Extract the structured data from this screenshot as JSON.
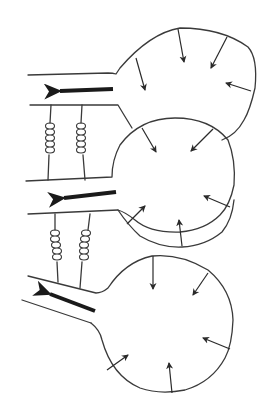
{
  "diagram": {
    "title_fragment": "",
    "colors": {
      "stroke": "#3a3a3a",
      "arrow": "#1a1a1a",
      "background": "#ffffff"
    },
    "bulbs": [
      {
        "id": "top",
        "inward_arrows": 5,
        "flow_arrow": "left"
      },
      {
        "id": "middle",
        "inward_arrows": 6,
        "flow_arrow": "left"
      },
      {
        "id": "bottom",
        "inward_arrows": 6,
        "flow_arrow": "up-left"
      }
    ],
    "coils": [
      {
        "between": [
          "top",
          "middle"
        ],
        "count": 2
      },
      {
        "between": [
          "middle",
          "bottom"
        ],
        "count": 2
      }
    ]
  }
}
